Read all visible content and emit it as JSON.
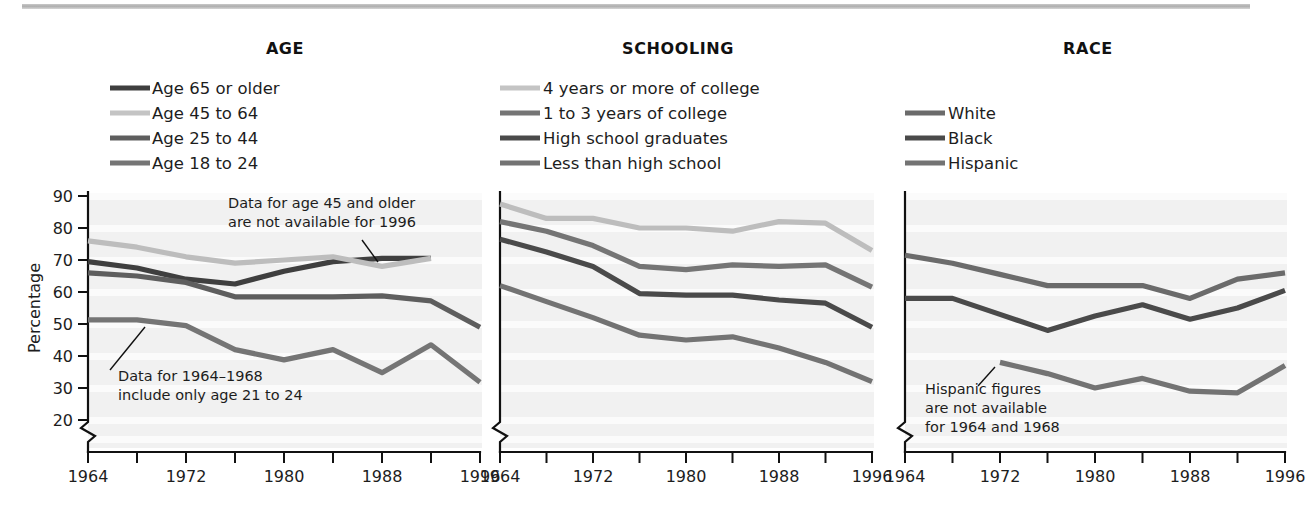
{
  "figure": {
    "width": 1307,
    "height": 514,
    "background": "#ffffff",
    "top_rule_color": "#b4b4b4"
  },
  "shared": {
    "ylabel": "Percentage",
    "y_ticks": [
      90,
      80,
      70,
      60,
      50,
      40,
      30,
      20
    ],
    "ylim": [
      20,
      90
    ],
    "axis_break": true,
    "x_ticks_all": [
      1964,
      1968,
      1972,
      1976,
      1980,
      1984,
      1988,
      1992,
      1996
    ],
    "x_tick_labels": [
      "1964",
      "1972",
      "1980",
      "1988",
      "1996"
    ],
    "x_labeled_values": [
      1964,
      1972,
      1980,
      1988,
      1996
    ],
    "xlim": [
      1964,
      1996
    ],
    "grid": "horizontal-bands",
    "band_color": "#e9e9e9",
    "plot_bg": "#f1f1f1"
  },
  "colors": {
    "very_dark": "#3f3f3f",
    "dark": "#555555",
    "medium": "#6f6f6f",
    "light": "#b9b9b9",
    "very_light": "#c8c8c8",
    "axis": "#111111",
    "text": "#1d1d1d"
  },
  "chart_data": [
    {
      "type": "line",
      "title": "AGE",
      "xlabel": "",
      "ylabel": "Percentage",
      "ylim": [
        20,
        90
      ],
      "xlim": [
        1964,
        1996
      ],
      "grid": true,
      "legend_position": "above-plot-left",
      "x": [
        1964,
        1968,
        1972,
        1976,
        1980,
        1984,
        1988,
        1992,
        1996
      ],
      "series": [
        {
          "name": "Age 65 or older",
          "color": "#3f3f3f",
          "swatch_color": "#3f3f3f",
          "x": [
            1964,
            1968,
            1972,
            1976,
            1980,
            1984,
            1988,
            1992
          ],
          "values": [
            69.5,
            67.5,
            64.0,
            62.5,
            66.5,
            69.5,
            70.5,
            70.5
          ]
        },
        {
          "name": "Age 45 to 64",
          "color": "#bdbdbd",
          "swatch_color": "#c4c4c4",
          "x": [
            1964,
            1968,
            1972,
            1976,
            1980,
            1984,
            1988,
            1992
          ],
          "values": [
            76.0,
            74.0,
            71.0,
            69.0,
            70.0,
            71.0,
            68.0,
            70.5
          ]
        },
        {
          "name": "Age 25 to 44",
          "color": "#5e5e5e",
          "swatch_color": "#5e5e5e",
          "x": [
            1964,
            1968,
            1972,
            1976,
            1980,
            1984,
            1988,
            1992,
            1996
          ],
          "values": [
            66.0,
            65.0,
            63.0,
            58.5,
            58.5,
            58.5,
            58.8,
            57.2,
            49.0
          ]
        },
        {
          "name": "Age 18 to 24",
          "color": "#757575",
          "swatch_color": "#757575",
          "x": [
            1964,
            1968,
            1972,
            1976,
            1980,
            1984,
            1988,
            1992,
            1996
          ],
          "values": [
            51.3,
            51.3,
            49.5,
            42.0,
            38.8,
            42.0,
            34.8,
            43.5,
            31.8
          ]
        }
      ],
      "annotations": [
        {
          "text_lines": [
            "Data for age 45 and older",
            "are not available for 1996"
          ],
          "x_px": 228,
          "y_px": 208,
          "leader_from": [
            378,
            262
          ],
          "leader_to": [
            362,
            240
          ]
        },
        {
          "text_lines": [
            "Data for 1964–1968",
            "include only age 21 to 24"
          ],
          "x_px": 118,
          "y_px": 381,
          "leader_from": [
            110,
            370
          ],
          "leader_to": [
            145,
            327
          ]
        }
      ]
    },
    {
      "type": "line",
      "title": "SCHOOLING",
      "xlabel": "",
      "ylabel": "",
      "ylim": [
        20,
        90
      ],
      "xlim": [
        1964,
        1996
      ],
      "grid": true,
      "legend_position": "above-plot-left",
      "x": [
        1964,
        1968,
        1972,
        1976,
        1980,
        1984,
        1988,
        1992,
        1996
      ],
      "series": [
        {
          "name": "4 years or more of college",
          "color": "#bdbdbd",
          "swatch_color": "#c4c4c4",
          "x": [
            1964,
            1968,
            1972,
            1976,
            1980,
            1984,
            1988,
            1992,
            1996
          ],
          "values": [
            87.5,
            83.0,
            83.0,
            80.0,
            80.0,
            79.0,
            82.0,
            81.5,
            73.0
          ]
        },
        {
          "name": "1 to 3 years of college",
          "color": "#757575",
          "swatch_color": "#757575",
          "x": [
            1964,
            1968,
            1972,
            1976,
            1980,
            1984,
            1988,
            1992,
            1996
          ],
          "values": [
            82.0,
            79.0,
            74.5,
            68.0,
            67.0,
            68.5,
            68.0,
            68.5,
            61.5
          ]
        },
        {
          "name": "High school graduates",
          "color": "#4a4a4a",
          "swatch_color": "#4a4a4a",
          "x": [
            1964,
            1968,
            1972,
            1976,
            1980,
            1984,
            1988,
            1992,
            1996
          ],
          "values": [
            76.5,
            72.5,
            68.0,
            59.5,
            59.0,
            59.0,
            57.5,
            56.5,
            49.0
          ]
        },
        {
          "name": "Less than high school",
          "color": "#737373",
          "swatch_color": "#737373",
          "x": [
            1964,
            1968,
            1972,
            1976,
            1980,
            1984,
            1988,
            1992,
            1996
          ],
          "values": [
            62.0,
            57.0,
            52.0,
            46.5,
            45.0,
            46.0,
            42.5,
            38.0,
            32.0
          ]
        }
      ],
      "annotations": []
    },
    {
      "type": "line",
      "title": "RACE",
      "xlabel": "",
      "ylabel": "",
      "ylim": [
        20,
        90
      ],
      "xlim": [
        1964,
        1996
      ],
      "grid": true,
      "legend_position": "above-plot-left",
      "x": [
        1964,
        1968,
        1972,
        1976,
        1980,
        1984,
        1988,
        1992,
        1996
      ],
      "series": [
        {
          "name": "White",
          "color": "#6b6b6b",
          "swatch_color": "#6b6b6b",
          "x": [
            1964,
            1968,
            1972,
            1976,
            1980,
            1984,
            1988,
            1992,
            1996
          ],
          "values": [
            71.5,
            69.0,
            65.5,
            62.0,
            62.0,
            62.0,
            58.0,
            64.0,
            66.0
          ]
        },
        {
          "name": "Black",
          "color": "#4a4a4a",
          "swatch_color": "#4a4a4a",
          "x": [
            1964,
            1968,
            1972,
            1976,
            1980,
            1984,
            1988,
            1992,
            1996
          ],
          "values": [
            58.0,
            58.0,
            53.0,
            48.0,
            52.5,
            56.0,
            51.5,
            55.0,
            60.5
          ]
        },
        {
          "name": "Hispanic",
          "color": "#737373",
          "swatch_color": "#737373",
          "x": [
            1972,
            1976,
            1980,
            1984,
            1988,
            1992,
            1996
          ],
          "values": [
            38.0,
            34.5,
            30.0,
            33.0,
            29.0,
            28.5,
            37.0
          ]
        }
      ],
      "annotations": [
        {
          "text_lines": [
            "Hispanic figures",
            "are not available",
            "for 1964 and 1968"
          ],
          "x_px": 925,
          "y_px": 394,
          "leader_from": [
            978,
            386
          ],
          "leader_to": [
            995,
            367
          ]
        }
      ]
    }
  ]
}
